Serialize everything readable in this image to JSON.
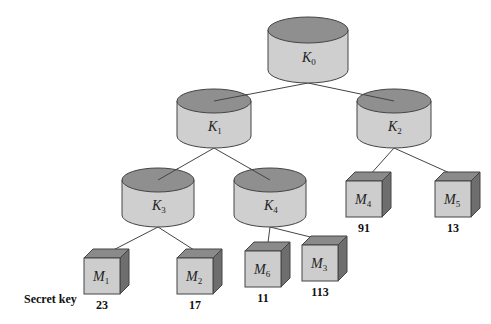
{
  "diagram": {
    "key_nodes": [
      {
        "id": "K0",
        "base": "K",
        "sub": "0",
        "cx": 308,
        "cy": 30,
        "rx": 40,
        "ry": 13,
        "h": 40
      },
      {
        "id": "K1",
        "base": "K",
        "sub": "1",
        "cx": 214,
        "cy": 101,
        "rx": 37,
        "ry": 12,
        "h": 35
      },
      {
        "id": "K2",
        "base": "K",
        "sub": "2",
        "cx": 394,
        "cy": 101,
        "rx": 37,
        "ry": 12,
        "h": 35
      },
      {
        "id": "K3",
        "base": "K",
        "sub": "3",
        "cx": 158,
        "cy": 180,
        "rx": 36,
        "ry": 12,
        "h": 35
      },
      {
        "id": "K4",
        "base": "K",
        "sub": "4",
        "cx": 270,
        "cy": 180,
        "rx": 36,
        "ry": 12,
        "h": 35
      }
    ],
    "leaf_nodes": [
      {
        "id": "M1",
        "base": "M",
        "sub": "1",
        "x": 84,
        "y": 258,
        "secret": "23"
      },
      {
        "id": "M2",
        "base": "M",
        "sub": "2",
        "x": 177,
        "y": 258,
        "secret": "17"
      },
      {
        "id": "M6",
        "base": "M",
        "sub": "6",
        "x": 245,
        "y": 251,
        "secret": "11"
      },
      {
        "id": "M3",
        "base": "M",
        "sub": "3",
        "x": 302,
        "y": 245,
        "secret": "113"
      },
      {
        "id": "M4",
        "base": "M",
        "sub": "4",
        "x": 346,
        "y": 181,
        "secret": "91"
      },
      {
        "id": "M5",
        "base": "M",
        "sub": "5",
        "x": 435,
        "y": 181,
        "secret": "13"
      }
    ],
    "edges": [
      [
        "K0",
        "K1"
      ],
      [
        "K0",
        "K2"
      ],
      [
        "K1",
        "K3"
      ],
      [
        "K1",
        "K4"
      ],
      [
        "K2",
        "M4"
      ],
      [
        "K2",
        "M5"
      ],
      [
        "K3",
        "M1"
      ],
      [
        "K3",
        "M2"
      ],
      [
        "K4",
        "M6"
      ],
      [
        "K4",
        "M3"
      ]
    ],
    "row_label": "Secret key",
    "colors": {
      "cyl_top": "#8f8f8f",
      "cyl_body": "#cfcfcf",
      "cube_front": "#cdcdcd",
      "cube_top": "#8a8a8a",
      "cube_side": "#6e6e6e",
      "stroke": "#444444"
    }
  }
}
